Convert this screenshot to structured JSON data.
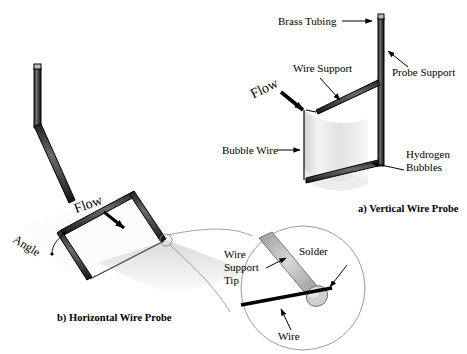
{
  "figure": {
    "title_present": false,
    "background_color": "#ffffff",
    "ink_color": "#000000",
    "tube_fill_color": "#5a5a5a",
    "tube_edge_color": "#1a1a1a",
    "sheet_color": "#e8e8e8",
    "shadow_color": "#cfcfcf"
  },
  "panel_a": {
    "caption": "a) Vertical Wire Probe",
    "flow_label": "Flow",
    "labels": {
      "brass_tubing": "Brass Tubing",
      "wire_support": "Wire Support",
      "probe_support": "Probe Support",
      "bubble_wire": "Bubble Wire",
      "hydrogen_bubbles_line1": "Hydrogen",
      "hydrogen_bubbles_line2": "Bubbles"
    }
  },
  "panel_b": {
    "caption": "b) Horizontal Wire Probe",
    "flow_label": "Flow",
    "labels": {
      "angle": "Angle"
    }
  },
  "inset_detail": {
    "labels": {
      "wire_support_tip_line1": "Wire",
      "wire_support_tip_line2": "Support",
      "wire_support_tip_line3": "Tip",
      "solder": "Solder",
      "wire": "Wire"
    }
  }
}
